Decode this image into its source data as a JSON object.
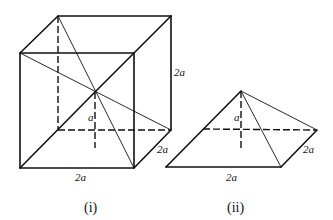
{
  "figure_i": {
    "caption": "(i)",
    "labels": {
      "height": "2a",
      "depth": "2a",
      "width": "2a",
      "pyramid_height": "a"
    }
  },
  "figure_ii": {
    "caption": "(ii)",
    "labels": {
      "pyramid_height": "a",
      "depth": "2a",
      "width": "2a"
    }
  }
}
